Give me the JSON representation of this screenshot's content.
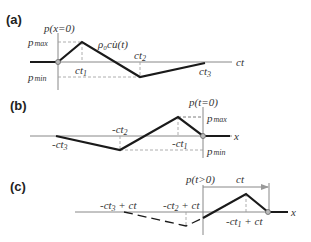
{
  "panels": [
    {
      "label": "(a)",
      "vertical_axis_label": "p(x=0)",
      "horizontal_axis_label": "ct",
      "pmax_label": "p",
      "pmax_sub": "max",
      "pmin_label": "p",
      "pmin_sub": "min",
      "slope_label": "ρ₀c",
      "slope_label_tail": "u̇(t)",
      "ticks": [
        {
          "main": "ct",
          "sub": "1"
        },
        {
          "main": "ct",
          "sub": "2"
        },
        {
          "main": "ct",
          "sub": "3"
        }
      ]
    },
    {
      "label": "(b)",
      "vertical_axis_label": "p(t=0)",
      "horizontal_axis_label": "x",
      "pmax_label": "p",
      "pmax_sub": "max",
      "pmin_label": "p",
      "pmin_sub": "min",
      "ticks": [
        {
          "main": "-ct",
          "sub": "3"
        },
        {
          "main": "-ct",
          "sub": "2"
        },
        {
          "main": "-ct",
          "sub": "1"
        }
      ]
    },
    {
      "label": "(c)",
      "vertical_axis_label": "p(t>0)",
      "horizontal_axis_label": "x",
      "shift_label": "ct",
      "ticks": [
        {
          "main": "-ct",
          "sub": "3",
          "tail": " + ct"
        },
        {
          "main": "-ct",
          "sub": "2",
          "tail": " + ct"
        },
        {
          "main": "-ct",
          "sub": "1",
          "tail": " + ct"
        }
      ]
    }
  ]
}
